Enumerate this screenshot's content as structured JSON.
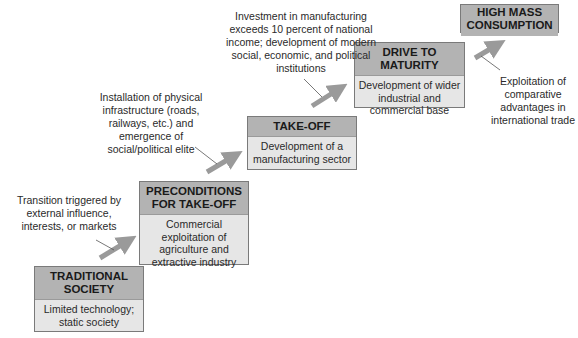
{
  "diagram": {
    "type": "staircase",
    "stages": [
      {
        "id": "traditional",
        "title": "TRADITIONAL SOCIETY",
        "title_lines": [
          "TRADITIONAL",
          "SOCIETY"
        ],
        "description": "Limited technology; static society"
      },
      {
        "id": "preconditions",
        "title": "PRECONDITIONS FOR TAKE-OFF",
        "title_lines": [
          "PRECONDITIONS",
          "FOR TAKE-OFF"
        ],
        "description": "Commercial exploitation of agriculture and extractive industry"
      },
      {
        "id": "takeoff",
        "title": "TAKE-OFF",
        "title_lines": [
          "TAKE-OFF"
        ],
        "description": "Development of a manufacturing sector"
      },
      {
        "id": "maturity",
        "title": "DRIVE TO MATURITY",
        "title_lines": [
          "DRIVE TO",
          "MATURITY"
        ],
        "description": "Development of wider industrial and commercial base"
      },
      {
        "id": "consumption",
        "title": "HIGH MASS CONSUMPTION",
        "title_lines": [
          "HIGH MASS",
          "CONSUMPTION"
        ],
        "description": ""
      }
    ],
    "transitions": [
      {
        "from": "traditional",
        "to": "preconditions",
        "note": "Transition triggered by external influence, interests, or markets"
      },
      {
        "from": "preconditions",
        "to": "takeoff",
        "note": "Installation of physical infrastructure (roads, railways, etc.) and emergence of social/political elite"
      },
      {
        "from": "takeoff",
        "to": "maturity",
        "note": "Investment in manufacturing exceeds 10 percent of national income; development of modern social, economic, and political institutions"
      },
      {
        "from": "maturity",
        "to": "consumption",
        "note": "Exploitation of comparative advantages in international trade"
      }
    ],
    "colors": {
      "title_fill": "#b3b3b3",
      "body_fill": "#e6e6e6",
      "border": "#7a7a7a",
      "arrow": "#9a9a9a"
    }
  }
}
